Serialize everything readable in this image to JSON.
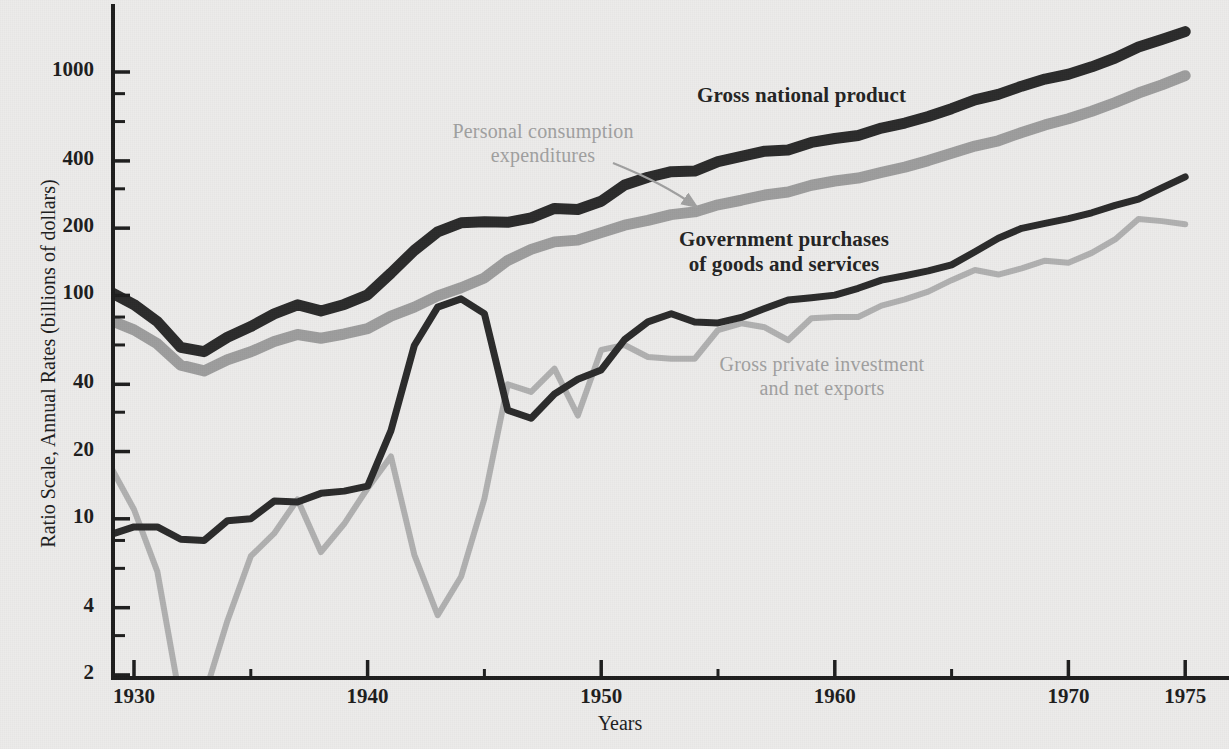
{
  "chart_data": {
    "type": "line",
    "title": "",
    "xlabel": "Years",
    "ylabel": "Ratio Scale, Annual Rates (billions of dollars)",
    "scale": "log",
    "grid": false,
    "legend_position": "inline-annotations",
    "xlim": [
      1929,
      1975
    ],
    "ylim": [
      2,
      1600
    ],
    "x_ticks": [
      1930,
      1940,
      1950,
      1960,
      1970,
      1975
    ],
    "x_tick_labels": [
      "1930",
      "1940",
      "1950",
      "1960",
      "1970",
      "1975"
    ],
    "x_minor_ticks": [
      1935,
      1945,
      1955,
      1965
    ],
    "y_ticks": [
      2,
      4,
      10,
      20,
      40,
      100,
      200,
      400,
      1000
    ],
    "y_tick_labels": [
      "2",
      "4",
      "10",
      "20",
      "40",
      "100",
      "200",
      "400",
      "1000"
    ],
    "x": [
      1929,
      1930,
      1931,
      1932,
      1933,
      1934,
      1935,
      1936,
      1937,
      1938,
      1939,
      1940,
      1941,
      1942,
      1943,
      1944,
      1945,
      1946,
      1947,
      1948,
      1949,
      1950,
      1951,
      1952,
      1953,
      1954,
      1955,
      1956,
      1957,
      1958,
      1959,
      1960,
      1961,
      1962,
      1963,
      1964,
      1965,
      1966,
      1967,
      1968,
      1969,
      1970,
      1971,
      1972,
      1973,
      1974,
      1975
    ],
    "series": [
      {
        "name": "Gross national product",
        "color": "#2b2b2b",
        "width": 11,
        "label_style": "dark-bold",
        "values": [
          103.4,
          91.0,
          76.3,
          58.5,
          56.0,
          65.0,
          72.5,
          82.7,
          90.8,
          85.2,
          91.1,
          100.6,
          125.8,
          159.1,
          192.5,
          211.4,
          213.4,
          212.4,
          222.5,
          245.0,
          242.3,
          264.0,
          312.0,
          338.0,
          358.0,
          360.0,
          397.0,
          419.0,
          442.0,
          448.0,
          484.0,
          504.0,
          520.0,
          561.0,
          591.0,
          632.0,
          685.0,
          750.0,
          794.0,
          864.0,
          930.0,
          977.0,
          1055.0,
          1155.0,
          1294.0,
          1397.0,
          1516.0
        ]
      },
      {
        "name": "Personal consumption expenditures",
        "color": "#9d9d9d",
        "width": 11,
        "label_style": "gray",
        "values": [
          77.3,
          70.1,
          60.7,
          48.7,
          45.9,
          51.5,
          55.9,
          62.2,
          66.8,
          64.3,
          67.2,
          71.0,
          80.8,
          88.6,
          99.5,
          108.2,
          119.7,
          143.4,
          160.7,
          173.6,
          176.8,
          191.0,
          206.3,
          216.7,
          230.0,
          236.5,
          254.4,
          266.7,
          281.4,
          290.1,
          311.2,
          325.2,
          335.2,
          355.1,
          375.0,
          401.2,
          432.8,
          466.3,
          492.1,
          536.2,
          579.5,
          617.6,
          667.2,
          729.0,
          805.0,
          876.0,
          963.0
        ]
      },
      {
        "name": "Government purchases of goods and services",
        "color": "#2b2b2b",
        "width": 7,
        "label_style": "dark-bold",
        "values": [
          8.5,
          9.2,
          9.2,
          8.1,
          8.0,
          9.8,
          10.0,
          12.0,
          11.9,
          13.0,
          13.3,
          14.0,
          24.8,
          59.7,
          88.6,
          96.5,
          82.9,
          30.6,
          28.2,
          36.2,
          42.1,
          46.4,
          63.4,
          76.1,
          82.8,
          76.0,
          75.3,
          79.7,
          87.3,
          95.4,
          97.6,
          100.3,
          107.6,
          117.1,
          122.5,
          128.7,
          137.0,
          156.8,
          180.1,
          199.6,
          210.0,
          220.5,
          234.3,
          253.1,
          269.5,
          302.7,
          339.0
        ]
      },
      {
        "name": "Gross private investment and net exports",
        "color": "#b0b0b0",
        "width": 6,
        "label_style": "gray",
        "values": [
          17.1,
          11.0,
          5.8,
          1.5,
          1.6,
          3.5,
          6.8,
          8.6,
          12.2,
          7.1,
          9.5,
          13.7,
          19.0,
          6.9,
          3.7,
          5.5,
          12.3,
          40.0,
          37.0,
          47.0,
          29.0,
          57.0,
          60.0,
          53.0,
          52.0,
          52.0,
          70.0,
          75.0,
          72.0,
          63.0,
          79.0,
          80.0,
          80.0,
          90.0,
          96.0,
          104.0,
          117.0,
          130.0,
          124.0,
          132.0,
          143.0,
          140.0,
          155.0,
          178.0,
          220.0,
          215.0,
          208.0
        ]
      }
    ],
    "annotations": [
      {
        "name": "gross-national-product",
        "text": "Gross national product",
        "style": "dark-bold"
      },
      {
        "name": "personal-consumption-expenditures",
        "line1": "Personal consumption",
        "line2": "expenditures",
        "style": "gray",
        "has_arrow": true
      },
      {
        "name": "government-purchases",
        "line1": "Government purchases",
        "line2": "of goods and services",
        "style": "dark-bold"
      },
      {
        "name": "gross-private-investment",
        "line1": "Gross private investment",
        "line2": "and net exports",
        "style": "gray"
      }
    ]
  },
  "axes": {
    "y_label": "Ratio Scale, Annual Rates (billions of dollars)",
    "x_label": "Years",
    "y_tick_labels": [
      "1000",
      "400",
      "200",
      "100",
      "40",
      "20",
      "10",
      "4",
      "2"
    ],
    "x_tick_labels": [
      "1930",
      "1940",
      "1950",
      "1960",
      "1970",
      "1975"
    ]
  },
  "labels": {
    "gnp": "Gross national product",
    "pce_line1": "Personal consumption",
    "pce_line2": "expenditures",
    "gov_line1": "Government purchases",
    "gov_line2": "of goods and services",
    "inv_line1": "Gross private investment",
    "inv_line2": "and net exports"
  },
  "colors": {
    "background": "#ecebea",
    "axis": "#1d1d1d",
    "gnp": "#2b2b2b",
    "pce": "#9d9d9d",
    "government": "#2b2b2b",
    "investment": "#b0b0b0"
  }
}
